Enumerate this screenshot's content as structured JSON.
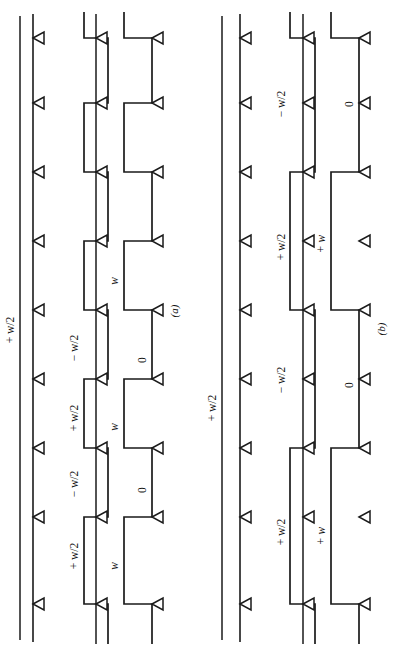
{
  "figure": {
    "orientation": "rotated-90",
    "background": "#ffffff",
    "ink_color": "#1a1a1a",
    "panels": [
      {
        "id": "a",
        "caption": "(a)",
        "reference_label": "+ w/2",
        "traces": [
          {
            "name": "reference-line",
            "kind": "straight",
            "label": "+ w/2"
          },
          {
            "name": "tick-baseline",
            "kind": "straight-ticked",
            "tick_count": 9
          },
          {
            "name": "bipolar-square-wave",
            "kind": "square",
            "labels": [
              "+ w/2",
              "− w/2",
              "+ w/2",
              "− w/2"
            ],
            "levels": [
              "+w/2",
              "-w/2"
            ]
          },
          {
            "name": "unipolar-pulse-train",
            "kind": "pulse",
            "labels": [
              "w",
              "0",
              "w",
              "0",
              "w"
            ],
            "levels": [
              "w",
              "0"
            ]
          }
        ]
      },
      {
        "id": "b",
        "caption": "(b)",
        "reference_label": "+ w/2",
        "traces": [
          {
            "name": "reference-line",
            "kind": "straight",
            "label": "+ w/2"
          },
          {
            "name": "tick-baseline",
            "kind": "straight-ticked",
            "tick_count": 9
          },
          {
            "name": "bipolar-square-wave",
            "kind": "square",
            "labels": [
              "+ w/2",
              "− w/2",
              "+ w/2",
              "− w/2"
            ],
            "levels": [
              "+w/2",
              "-w/2"
            ]
          },
          {
            "name": "unipolar-pulse-train",
            "kind": "pulse",
            "labels": [
              "+ w",
              "0",
              "+ w",
              "0"
            ],
            "levels": [
              "+w",
              "0"
            ]
          }
        ]
      }
    ],
    "labels": {
      "plus_w_half": "+ w/2",
      "minus_w_half": "− w/2",
      "w": "w",
      "plus_w": "+ w",
      "zero": "0",
      "caption_a": "(a)",
      "caption_b": "(b)"
    }
  }
}
